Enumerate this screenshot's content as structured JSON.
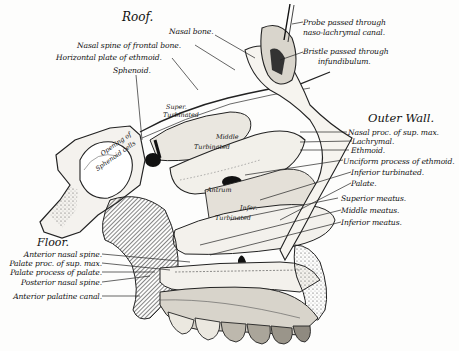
{
  "figure": {
    "headings": {
      "roof": "Roof.",
      "outer_wall": "Outer Wall.",
      "floor": "Floor."
    },
    "roof_labels": [
      "Nasal bone.",
      "Nasal spine of frontal bone.",
      "Horizontal plate of ethmoid.",
      "Sphenoid."
    ],
    "top_right_labels": {
      "probe_line1": "Probe passed through",
      "probe_line2": "naso-lachrymal canal.",
      "bristle_line1": "Bristle passed through",
      "bristle_line2": "infundibulum."
    },
    "outer_wall_labels": [
      "Nasal proc. of sup. max.",
      "Lachrymal.",
      "Ethmoid.",
      "Unciform process of ethmoid.",
      "Inferior turbinated.",
      "Palate.",
      "Superior meatus.",
      "Middle meatus.",
      "Inferior meatus."
    ],
    "floor_labels": [
      "Anterior nasal spine.",
      "Palate proc. of sup. max.",
      "Palate process of palate.",
      "Posterior nasal spine.",
      "Anterior palatine canal."
    ],
    "inline_labels": {
      "superior_turbinated_1": "Super.",
      "superior_turbinated_2": "Turbinated",
      "middle_turbinated_1": "Middle",
      "middle_turbinated_2": "Turbinated",
      "antrum": "Antrum",
      "inferior_turbinated_1": "Infer.",
      "inferior_turbinated_2": "Turbinated",
      "sphenoid_cells_1": "Opening of",
      "sphenoid_cells_2": "Sphenoid cells"
    }
  }
}
